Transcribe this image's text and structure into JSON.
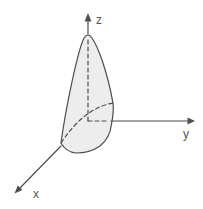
{
  "figure": {
    "type": "3d-cone-on-coordinate-axes",
    "axis_labels": {
      "x": "x",
      "y": "y",
      "z": "z"
    },
    "colors": {
      "background": "#ffffff",
      "line": "#4d4d4d",
      "label": "#555555",
      "cone_fill": "#ededed"
    }
  }
}
